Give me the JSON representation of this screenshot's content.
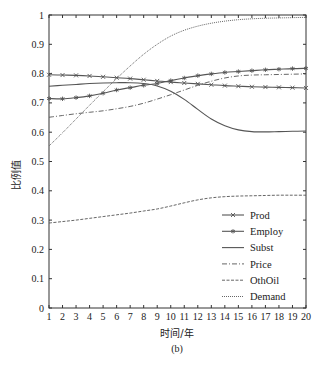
{
  "chart_data": {
    "type": "line",
    "title": "",
    "caption": "(b)",
    "xlabel": "时间/年",
    "ylabel": "比例值",
    "xlim": [
      1,
      20
    ],
    "ylim": [
      0,
      1
    ],
    "x": [
      1,
      2,
      3,
      4,
      5,
      6,
      7,
      8,
      9,
      10,
      11,
      12,
      13,
      14,
      15,
      16,
      17,
      18,
      19,
      20
    ],
    "x_ticks": [
      "1",
      "2",
      "3",
      "4",
      "5",
      "6",
      "7",
      "8",
      "9",
      "10",
      "11",
      "12",
      "13",
      "14",
      "15",
      "16",
      "17",
      "18",
      "19",
      "20"
    ],
    "y_ticks": [
      "0",
      "0.1",
      "0.2",
      "0.3",
      "0.4",
      "0.5",
      "0.6",
      "0.7",
      "0.8",
      "0.9",
      "1"
    ],
    "grid": false,
    "legend_position": "lower right",
    "series": [
      {
        "name": "Prod",
        "style": "line-x-marker",
        "values": [
          0.796,
          0.795,
          0.794,
          0.792,
          0.789,
          0.786,
          0.783,
          0.779,
          0.775,
          0.771,
          0.768,
          0.765,
          0.762,
          0.759,
          0.757,
          0.755,
          0.754,
          0.753,
          0.752,
          0.751
        ]
      },
      {
        "name": "Employ",
        "style": "line-star-marker",
        "values": [
          0.715,
          0.714,
          0.718,
          0.724,
          0.733,
          0.744,
          0.752,
          0.76,
          0.766,
          0.776,
          0.785,
          0.793,
          0.799,
          0.804,
          0.807,
          0.81,
          0.813,
          0.815,
          0.817,
          0.818
        ]
      },
      {
        "name": "Subst",
        "style": "solid",
        "values": [
          0.757,
          0.76,
          0.763,
          0.766,
          0.768,
          0.769,
          0.769,
          0.766,
          0.758,
          0.74,
          0.712,
          0.678,
          0.645,
          0.622,
          0.608,
          0.602,
          0.601,
          0.602,
          0.603,
          0.604
        ]
      },
      {
        "name": "Price",
        "style": "dash-dot",
        "values": [
          0.651,
          0.657,
          0.663,
          0.668,
          0.673,
          0.68,
          0.688,
          0.699,
          0.713,
          0.728,
          0.744,
          0.76,
          0.774,
          0.785,
          0.792,
          0.795,
          0.796,
          0.797,
          0.798,
          0.799
        ]
      },
      {
        "name": "OthOil",
        "style": "dashed",
        "values": [
          0.29,
          0.295,
          0.3,
          0.306,
          0.312,
          0.318,
          0.324,
          0.331,
          0.338,
          0.348,
          0.359,
          0.369,
          0.376,
          0.38,
          0.382,
          0.383,
          0.384,
          0.385,
          0.385,
          0.385
        ]
      },
      {
        "name": "Demand",
        "style": "dotted",
        "values": [
          0.553,
          0.598,
          0.645,
          0.692,
          0.738,
          0.783,
          0.826,
          0.866,
          0.9,
          0.928,
          0.948,
          0.962,
          0.972,
          0.979,
          0.984,
          0.987,
          0.989,
          0.99,
          0.991,
          0.992
        ]
      }
    ]
  },
  "colors": {
    "axis": "#333333",
    "series": "#555555",
    "background": "#ffffff"
  }
}
